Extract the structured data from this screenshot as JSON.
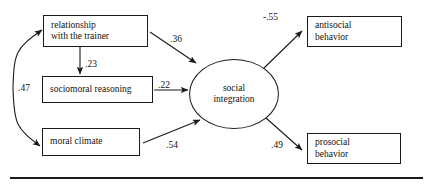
{
  "diagram": {
    "type": "path-model",
    "title": "",
    "nodes": [
      {
        "id": "relationship_trainer",
        "shape": "rect",
        "lines": [
          "relationship",
          "with the trainer"
        ]
      },
      {
        "id": "sociomoral_reasoning",
        "shape": "rect",
        "lines": [
          "sociomoral reasoning"
        ]
      },
      {
        "id": "moral_climate",
        "shape": "rect",
        "lines": [
          "moral climate"
        ]
      },
      {
        "id": "social_integration",
        "shape": "ellipse",
        "lines": [
          "social",
          "integration"
        ]
      },
      {
        "id": "antisocial_behavior",
        "shape": "rect",
        "lines": [
          "antisocial",
          "behavior"
        ]
      },
      {
        "id": "prosocial_behavior",
        "shape": "rect",
        "lines": [
          "prosocial",
          "behavior"
        ]
      }
    ],
    "edges": [
      {
        "id": "rel_to_social",
        "from": "relationship_trainer",
        "to": "social_integration",
        "label": ".36",
        "arrows": "single"
      },
      {
        "id": "rel_to_socio",
        "from": "relationship_trainer",
        "to": "sociomoral_reasoning",
        "label": ".23",
        "arrows": "single"
      },
      {
        "id": "socio_to_social",
        "from": "sociomoral_reasoning",
        "to": "social_integration",
        "label": ".22",
        "arrows": "single"
      },
      {
        "id": "moral_to_social",
        "from": "moral_climate",
        "to": "social_integration",
        "label": ".54",
        "arrows": "single"
      },
      {
        "id": "rel_moral_corr",
        "from": "relationship_trainer",
        "to": "moral_climate",
        "label": ".47",
        "arrows": "double"
      },
      {
        "id": "social_to_antisocial",
        "from": "social_integration",
        "to": "antisocial_behavior",
        "label": "-.55",
        "arrows": "single"
      },
      {
        "id": "social_to_prosocial",
        "from": "social_integration",
        "to": "prosocial_behavior",
        "label": ".49",
        "arrows": "single"
      }
    ],
    "colors": {
      "stroke": "#1a1a1a",
      "text": "#111111",
      "background": "#ffffff"
    }
  },
  "footer_rule": {
    "present": true
  }
}
